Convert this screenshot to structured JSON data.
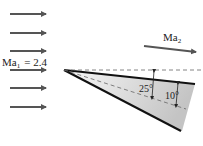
{
  "diagram": {
    "upstream_label": "Ma",
    "upstream_sub": "1",
    "upstream_value": "= 2.4",
    "downstream_label": "Ma",
    "downstream_sub": "2",
    "angle_outer": "25°",
    "angle_inner": "10°"
  },
  "colors": {
    "arrow": "#555555",
    "wedge_edge": "#111111",
    "dashed": "#666666",
    "fill_dark": "#bdbdbd",
    "fill_light": "#f8f8f8"
  }
}
